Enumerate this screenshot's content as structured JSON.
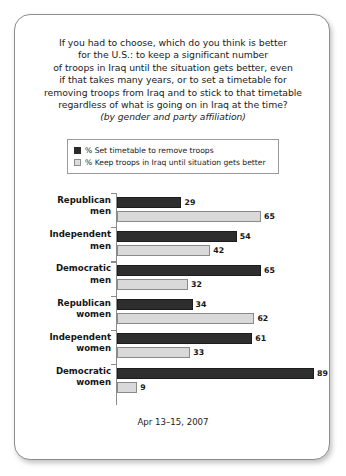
{
  "card": {
    "title_lines": [
      "If you had to choose, which do you think is better",
      "for the U.S.: to keep a significant number",
      "of troops in Iraq until the situation gets better, even",
      "if that takes many years, or to set a timetable for",
      "removing troops from Iraq and to stick to that timetable",
      "regardless of what is going on in Iraq at the time?"
    ],
    "subtitle": "(by gender and party affiliation)",
    "footer": "Apr 13–15, 2007"
  },
  "legend": {
    "items": [
      {
        "label": "% Set timetable to remove troops",
        "swatch": "dark",
        "color": "#2b2b2b"
      },
      {
        "label": "% Keep troops in Iraq until situation gets better",
        "swatch": "light",
        "color": "#dcdcdc"
      }
    ]
  },
  "chart_data": {
    "type": "bar",
    "orientation": "horizontal",
    "subtitle": "(by gender and party affiliation)",
    "xlabel": "",
    "ylabel": "",
    "xlim": [
      0,
      100
    ],
    "grid": false,
    "legend_position": "top",
    "categories": [
      "Republican men",
      "Independent men",
      "Democratic men",
      "Republican women",
      "Independent women",
      "Democratic women"
    ],
    "category_lines": [
      [
        "Republican",
        "men"
      ],
      [
        "Independent",
        "men"
      ],
      [
        "Democratic",
        "men"
      ],
      [
        "Republican",
        "women"
      ],
      [
        "Independent",
        "women"
      ],
      [
        "Democratic",
        "women"
      ]
    ],
    "series": [
      {
        "name": "% Set timetable to remove troops",
        "color": "#2e2e2e",
        "values": [
          29,
          54,
          65,
          34,
          61,
          89
        ]
      },
      {
        "name": "% Keep troops in Iraq until situation gets better",
        "color": "#d9d9d9",
        "values": [
          65,
          42,
          32,
          62,
          33,
          9
        ]
      }
    ],
    "annotation": "Apr 13–15, 2007"
  }
}
